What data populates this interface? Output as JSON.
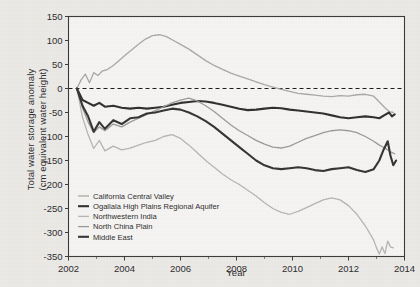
{
  "chart_data": {
    "type": "line",
    "title": "",
    "xlabel": "Year",
    "ylabel": "Total water storage anomaly\n(cm equivalent water height)",
    "ylabel_line1": "Total water storage anomaly",
    "ylabel_line2": "(cm equivalent water height)",
    "xlim": [
      2002,
      2014
    ],
    "ylim": [
      -350,
      150
    ],
    "xticks": [
      2002,
      2004,
      2006,
      2008,
      2010,
      2012,
      2014
    ],
    "xticklabels": [
      "2002",
      "2004",
      "2006",
      "2008",
      "2010",
      "2012",
      "2014"
    ],
    "xminorticks": [
      2003,
      2005,
      2007,
      2009,
      2011,
      2013
    ],
    "yticks": [
      -350,
      -300,
      -250,
      -200,
      -150,
      -100,
      -50,
      0,
      50,
      100,
      150
    ],
    "yticklabels": [
      "-350",
      "-300",
      "-250",
      "-200",
      "-150",
      "-100",
      "-50",
      "0",
      "50",
      "100",
      "150"
    ],
    "grid": false,
    "legend_position": "lower left inside axes",
    "zero_reference_line": {
      "value": 0,
      "style": "dashed",
      "color": "#1a1a1a"
    },
    "series": [
      {
        "name": "California Central Valley",
        "color": "#a8a8a8",
        "width": 1.3,
        "x": [
          2002.3,
          2002.45,
          2002.6,
          2002.75,
          2002.9,
          2003.05,
          2003.2,
          2003.4,
          2003.6,
          2003.8,
          2004.0,
          2004.25,
          2004.5,
          2004.75,
          2005.0,
          2005.25,
          2005.5,
          2005.75,
          2006.0,
          2006.3,
          2006.6,
          2006.9,
          2007.2,
          2007.5,
          2007.8,
          2008.1,
          2008.4,
          2008.7,
          2009.0,
          2009.3,
          2009.6,
          2009.9,
          2010.2,
          2010.5,
          2010.8,
          2011.1,
          2011.4,
          2011.7,
          2012.0,
          2012.3,
          2012.6,
          2012.9,
          2013.1,
          2013.3,
          2013.45,
          2013.6
        ],
        "y": [
          0,
          18,
          30,
          12,
          33,
          27,
          36,
          40,
          48,
          58,
          68,
          80,
          92,
          103,
          110,
          112,
          108,
          100,
          92,
          82,
          70,
          58,
          48,
          40,
          32,
          26,
          20,
          14,
          8,
          3,
          -2,
          -6,
          -10,
          -12,
          -14,
          -16,
          -17,
          -15,
          -16,
          -13,
          -12,
          -16,
          -28,
          -40,
          -48,
          -50
        ]
      },
      {
        "name": "Ogallala High Plains Regional Aquifer",
        "color": "#2e2e2e",
        "width": 2.1,
        "x": [
          2002.3,
          2002.5,
          2002.7,
          2002.9,
          2003.1,
          2003.3,
          2003.6,
          2003.9,
          2004.2,
          2004.5,
          2004.8,
          2005.1,
          2005.4,
          2005.7,
          2006.0,
          2006.3,
          2006.6,
          2006.9,
          2007.2,
          2007.5,
          2007.8,
          2008.1,
          2008.4,
          2008.7,
          2009.0,
          2009.3,
          2009.6,
          2009.9,
          2010.2,
          2010.5,
          2010.8,
          2011.1,
          2011.4,
          2011.7,
          2012.0,
          2012.3,
          2012.6,
          2012.9,
          2013.1,
          2013.3,
          2013.45,
          2013.55,
          2013.65
        ],
        "y": [
          0,
          -24,
          -30,
          -36,
          -30,
          -38,
          -36,
          -40,
          -42,
          -40,
          -42,
          -40,
          -38,
          -34,
          -30,
          -28,
          -26,
          -27,
          -30,
          -34,
          -38,
          -42,
          -45,
          -44,
          -42,
          -40,
          -41,
          -44,
          -46,
          -48,
          -50,
          -52,
          -56,
          -60,
          -62,
          -60,
          -58,
          -60,
          -62,
          -55,
          -50,
          -58,
          -54
        ]
      },
      {
        "name": "Northwestern India",
        "color": "#b5b5b5",
        "width": 1.3,
        "x": [
          2002.3,
          2002.5,
          2002.7,
          2002.9,
          2003.1,
          2003.3,
          2003.6,
          2003.9,
          2004.2,
          2004.5,
          2004.8,
          2005.1,
          2005.4,
          2005.7,
          2006.0,
          2006.3,
          2006.6,
          2006.9,
          2007.2,
          2007.5,
          2007.8,
          2008.1,
          2008.4,
          2008.7,
          2009.0,
          2009.3,
          2009.6,
          2009.9,
          2010.2,
          2010.5,
          2010.8,
          2011.1,
          2011.4,
          2011.7,
          2012.0,
          2012.3,
          2012.6,
          2012.9,
          2013.0,
          2013.1,
          2013.2,
          2013.3,
          2013.4,
          2013.5,
          2013.6
        ],
        "y": [
          0,
          -60,
          -96,
          -125,
          -108,
          -130,
          -120,
          -128,
          -124,
          -118,
          -112,
          -108,
          -100,
          -96,
          -104,
          -118,
          -134,
          -150,
          -164,
          -178,
          -190,
          -200,
          -212,
          -224,
          -238,
          -250,
          -258,
          -262,
          -256,
          -248,
          -240,
          -232,
          -228,
          -232,
          -244,
          -262,
          -286,
          -316,
          -332,
          -345,
          -330,
          -344,
          -318,
          -330,
          -332
        ]
      },
      {
        "name": "North China Plain",
        "color": "#9a9a9a",
        "width": 1.3,
        "x": [
          2002.3,
          2002.5,
          2002.7,
          2002.9,
          2003.1,
          2003.3,
          2003.6,
          2003.9,
          2004.2,
          2004.5,
          2004.8,
          2005.1,
          2005.4,
          2005.7,
          2006.0,
          2006.3,
          2006.6,
          2006.9,
          2007.2,
          2007.5,
          2007.8,
          2008.1,
          2008.4,
          2008.7,
          2009.0,
          2009.3,
          2009.6,
          2009.9,
          2010.2,
          2010.5,
          2010.8,
          2011.1,
          2011.4,
          2011.7,
          2012.0,
          2012.3,
          2012.6,
          2012.9,
          2013.1,
          2013.3,
          2013.5,
          2013.65
        ],
        "y": [
          0,
          -40,
          -70,
          -92,
          -80,
          -88,
          -74,
          -80,
          -70,
          -62,
          -54,
          -46,
          -38,
          -30,
          -24,
          -20,
          -26,
          -36,
          -48,
          -62,
          -76,
          -88,
          -98,
          -108,
          -116,
          -122,
          -124,
          -120,
          -112,
          -104,
          -98,
          -92,
          -88,
          -86,
          -88,
          -92,
          -100,
          -110,
          -118,
          -124,
          -132,
          -136
        ]
      },
      {
        "name": "Middle East",
        "color": "#333333",
        "width": 2.1,
        "x": [
          2002.3,
          2002.5,
          2002.7,
          2002.9,
          2003.1,
          2003.3,
          2003.6,
          2003.9,
          2004.2,
          2004.5,
          2004.8,
          2005.1,
          2005.4,
          2005.7,
          2006.0,
          2006.3,
          2006.6,
          2006.9,
          2007.2,
          2007.5,
          2007.8,
          2008.1,
          2008.4,
          2008.7,
          2009.0,
          2009.3,
          2009.6,
          2009.9,
          2010.2,
          2010.5,
          2010.8,
          2011.1,
          2011.4,
          2011.7,
          2012.0,
          2012.3,
          2012.6,
          2012.9,
          2013.1,
          2013.25,
          2013.4,
          2013.5,
          2013.6,
          2013.7
        ],
        "y": [
          0,
          -36,
          -58,
          -90,
          -70,
          -84,
          -66,
          -74,
          -62,
          -60,
          -52,
          -50,
          -46,
          -42,
          -44,
          -50,
          -58,
          -68,
          -80,
          -94,
          -108,
          -122,
          -136,
          -150,
          -160,
          -166,
          -168,
          -166,
          -164,
          -166,
          -170,
          -172,
          -168,
          -166,
          -164,
          -170,
          -174,
          -168,
          -150,
          -128,
          -110,
          -140,
          -160,
          -150
        ]
      }
    ]
  },
  "legend": {
    "items": [
      {
        "label": "California Central Valley"
      },
      {
        "label": "Ogallala High Plains Regional Aquifer"
      },
      {
        "label": "Northwestern India"
      },
      {
        "label": "North China Plain"
      },
      {
        "label": "Middle East"
      }
    ]
  }
}
